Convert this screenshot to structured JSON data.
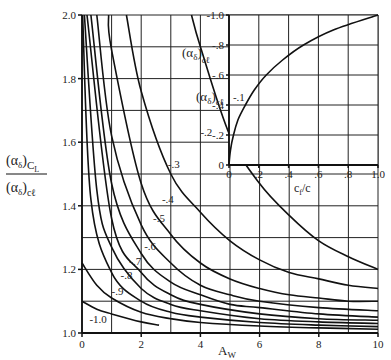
{
  "chart_data": [
    {
      "type": "line",
      "title": "",
      "xlabel": "A",
      "xlabel_sub": "W",
      "ylabel_num": "(α",
      "ylabel_num_sub": "δ",
      "ylabel_num_tail": ")",
      "ylabel_num_subscript": "C",
      "ylabel_num_subscript2": "L",
      "ylabel_den": "(α",
      "ylabel_den_sub": "δ",
      "ylabel_den_tail": ")",
      "ylabel_den_subscript": "cℓ",
      "xlim": [
        0,
        10
      ],
      "ylim": [
        1.0,
        2.0
      ],
      "grid": true,
      "x_ticks": [
        0,
        2,
        4,
        6,
        8,
        10
      ],
      "x_tick_labels": [
        "0",
        "2",
        "4",
        "6",
        "8",
        "10"
      ],
      "y_ticks": [
        1.0,
        1.2,
        1.4,
        1.6,
        1.8,
        2.0
      ],
      "y_tick_labels": [
        "1.0",
        "1.2",
        "1.4",
        "1.6",
        "1.8",
        "2.0"
      ],
      "legend_title": "(α",
      "legend_title_sub": "δ",
      "legend_title_tail": ")",
      "legend_title_subscript": "cℓ",
      "series": [
        {
          "name": "-.1",
          "label": "-.1",
          "points": [
            [
              3.7,
              2.0
            ],
            [
              4,
              1.9
            ],
            [
              5,
              1.62
            ],
            [
              6,
              1.47
            ],
            [
              7,
              1.37
            ],
            [
              8,
              1.29
            ],
            [
              9,
              1.24
            ],
            [
              10,
              1.2
            ]
          ]
        },
        {
          "name": "-.2",
          "label": "-.2",
          "points": [
            [
              1.5,
              2.0
            ],
            [
              2,
              1.76
            ],
            [
              3,
              1.5
            ],
            [
              4,
              1.38
            ],
            [
              5,
              1.29
            ],
            [
              6,
              1.23
            ],
            [
              7,
              1.19
            ],
            [
              8,
              1.17
            ],
            [
              9,
              1.15
            ],
            [
              10,
              1.14
            ]
          ]
        },
        {
          "name": "-.3",
          "label": "-.3",
          "points": [
            [
              0.9,
              2.0
            ],
            [
              1,
              1.89
            ],
            [
              2,
              1.47
            ],
            [
              3,
              1.31
            ],
            [
              4,
              1.22
            ],
            [
              5,
              1.17
            ],
            [
              6,
              1.14
            ],
            [
              7,
              1.12
            ],
            [
              8,
              1.11
            ],
            [
              9,
              1.1
            ],
            [
              10,
              1.1
            ]
          ]
        },
        {
          "name": "-.4",
          "label": "-.4",
          "points": [
            [
              0.5,
              2.0
            ],
            [
              1,
              1.62
            ],
            [
              2,
              1.34
            ],
            [
              3,
              1.22
            ],
            [
              4,
              1.15
            ],
            [
              5,
              1.12
            ],
            [
              6,
              1.1
            ],
            [
              8,
              1.08
            ],
            [
              10,
              1.07
            ]
          ]
        },
        {
          "name": "-.5",
          "label": "-.5",
          "points": [
            [
              0.3,
              2.0
            ],
            [
              1,
              1.47
            ],
            [
              2,
              1.25
            ],
            [
              3,
              1.16
            ],
            [
              4,
              1.12
            ],
            [
              5,
              1.09
            ],
            [
              6,
              1.08
            ],
            [
              8,
              1.06
            ],
            [
              10,
              1.05
            ]
          ]
        },
        {
          "name": "-.6",
          "label": "-.6",
          "points": [
            [
              0.17,
              2.0
            ],
            [
              1,
              1.36
            ],
            [
              2,
              1.19
            ],
            [
              3,
              1.12
            ],
            [
              4,
              1.09
            ],
            [
              6,
              1.06
            ],
            [
              8,
              1.045
            ],
            [
              10,
              1.04
            ]
          ]
        },
        {
          "name": "-.7",
          "label": "-.7",
          "points": [
            [
              0.08,
              2.0
            ],
            [
              0.5,
              1.45
            ],
            [
              1,
              1.27
            ],
            [
              2,
              1.14
            ],
            [
              3,
              1.09
            ],
            [
              4,
              1.07
            ],
            [
              6,
              1.045
            ],
            [
              8,
              1.035
            ],
            [
              10,
              1.03
            ]
          ]
        },
        {
          "name": "-.8",
          "label": "-.8",
          "points": [
            [
              0.02,
              2.0
            ],
            [
              0.3,
              1.42
            ],
            [
              1,
              1.19
            ],
            [
              2,
              1.1
            ],
            [
              3,
              1.065
            ],
            [
              4,
              1.05
            ],
            [
              6,
              1.033
            ],
            [
              8,
              1.025
            ],
            [
              10,
              1.02
            ]
          ]
        },
        {
          "name": "-.9",
          "label": "-.9",
          "points": [
            [
              0,
              1.22
            ],
            [
              0.5,
              1.15
            ],
            [
              1,
              1.11
            ],
            [
              2,
              1.065
            ],
            [
              3,
              1.045
            ],
            [
              4,
              1.033
            ],
            [
              6,
              1.022
            ],
            [
              8,
              1.016
            ],
            [
              10,
              1.012
            ]
          ]
        },
        {
          "name": "-1.0",
          "label": "-1.0",
          "points": [
            [
              0,
              1.1
            ],
            [
              0.5,
              1.075
            ],
            [
              1,
              1.06
            ],
            [
              2,
              1.035
            ],
            [
              2.6,
              1.025
            ]
          ]
        }
      ]
    },
    {
      "type": "line",
      "title": "",
      "xlabel": "c",
      "xlabel_sub": "f",
      "xlabel_tail": "/c",
      "ylabel": "(α",
      "ylabel_sub": "δ",
      "ylabel_tail": ")",
      "ylabel_subscript": "cℓ",
      "xlim": [
        0,
        1.0
      ],
      "ylim": [
        0,
        -1.0
      ],
      "grid": true,
      "x_ticks": [
        0,
        0.2,
        0.4,
        0.6,
        0.8,
        1.0
      ],
      "x_tick_labels": [
        "0",
        ".2",
        ".4",
        ".6",
        ".8",
        "1.0"
      ],
      "y_ticks": [
        0,
        -0.2,
        -0.4,
        -0.6,
        -0.8,
        -1.0
      ],
      "y_tick_labels": [
        "0",
        "-.2",
        "-.4",
        "-.6",
        "-.8",
        "-1.0"
      ],
      "series": [
        {
          "name": "flap effectiveness",
          "points": [
            [
              0,
              0
            ],
            [
              0.01,
              -0.1
            ],
            [
              0.03,
              -0.2
            ],
            [
              0.06,
              -0.3
            ],
            [
              0.11,
              -0.4
            ],
            [
              0.17,
              -0.5
            ],
            [
              0.25,
              -0.6
            ],
            [
              0.36,
              -0.7
            ],
            [
              0.5,
              -0.8
            ],
            [
              0.7,
              -0.9
            ],
            [
              1.0,
              -1.0
            ]
          ]
        }
      ]
    }
  ]
}
